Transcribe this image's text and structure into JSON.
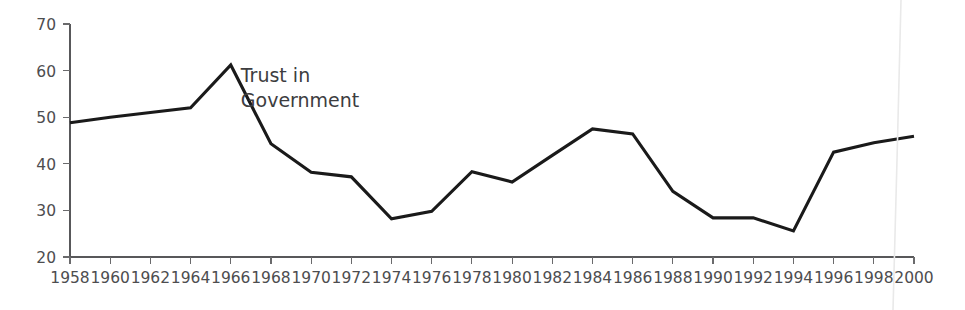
{
  "chart_data": {
    "type": "line",
    "title": "",
    "subtitle": "",
    "xlabel": "",
    "ylabel": "",
    "xlim": [
      1958,
      2000
    ],
    "ylim": [
      20,
      70
    ],
    "grid": false,
    "legend_position": "inline-annotation",
    "annotations": [
      {
        "text_line1": "Trust in",
        "text_line2": "Government",
        "x": 1966.5,
        "y": 57.5
      }
    ],
    "series": [
      {
        "name": "Trust in Government",
        "color": "#1a1a1a",
        "x": [
          1958,
          1960,
          1962,
          1964,
          1966,
          1968,
          1970,
          1972,
          1974,
          1976,
          1978,
          1980,
          1982,
          1984,
          1986,
          1988,
          1990,
          1992,
          1994,
          1996,
          1998,
          2000
        ],
        "values": [
          48.8,
          50,
          51,
          52,
          61.2,
          44.3,
          38.2,
          37.2,
          28.2,
          29.8,
          38.3,
          36.1,
          41.8,
          47.5,
          46.4,
          34.1,
          28.4,
          28.4,
          25.6,
          42.5,
          44.5,
          45.9
        ]
      }
    ],
    "x_tick_labels": [
      "1958",
      "1960",
      "1962",
      "1964",
      "1966",
      "1968",
      "1970",
      "1972",
      "1974",
      "1976",
      "1978",
      "1980",
      "1982",
      "1984",
      "1986",
      "1988",
      "1990",
      "1992",
      "1994",
      "1996",
      "1998",
      "2000"
    ],
    "y_tick_labels": [
      "20",
      "30",
      "40",
      "50",
      "60",
      "70"
    ],
    "y_ticks": [
      20,
      30,
      40,
      50,
      60,
      70
    ]
  },
  "colors": {
    "series": "#1a1a1a",
    "axis": "#58585a",
    "tick_text": "#4d4d4f",
    "annotation_text": "#3d3d3f",
    "background": "#ffffff"
  }
}
